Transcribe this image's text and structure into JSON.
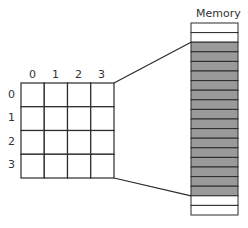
{
  "memory": {
    "title": "Memory",
    "cells": [
      "empty",
      "empty",
      "filled",
      "filled",
      "filled",
      "filled",
      "filled",
      "filled",
      "filled",
      "filled",
      "filled",
      "filled",
      "filled",
      "filled",
      "filled",
      "filled",
      "filled",
      "filled",
      "empty",
      "empty"
    ]
  },
  "grid": {
    "rows": 4,
    "cols": 4,
    "col_labels": [
      "0",
      "1",
      "2",
      "3"
    ],
    "row_labels": [
      "0",
      "1",
      "2",
      "3"
    ]
  },
  "colors": {
    "filled": "#9a9a9a",
    "empty": "#ffffff",
    "stroke": "#2a2a2a"
  }
}
